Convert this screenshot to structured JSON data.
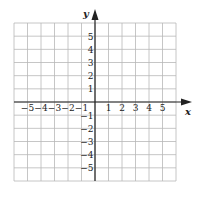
{
  "diagram": {
    "type": "coordinate-grid",
    "x_axis_label": "x",
    "y_axis_label": "y",
    "x_range": [
      -6,
      6
    ],
    "y_range": [
      -6,
      6
    ],
    "x_tick_labels": [
      "−5",
      "−4",
      "−3",
      "−2",
      "−1",
      "1",
      "2",
      "3",
      "4",
      "5"
    ],
    "y_tick_labels": [
      "5",
      "4",
      "3",
      "2",
      "1",
      "−1",
      "−2",
      "−3",
      "−4",
      "−5"
    ],
    "grid_color": "#b8b8b8",
    "axis_color": "#222222"
  }
}
